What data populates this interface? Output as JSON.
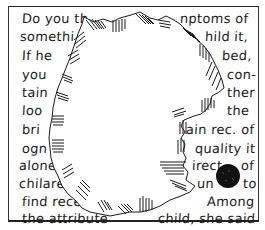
{
  "illustration": {
    "description": "Hand-drawn page of handwritten text with a large torn, hatched hole in the center and a black ink blot",
    "colors": {
      "ink": "#1a1a1a",
      "paper": "#ffffff",
      "blot": "#111111"
    }
  },
  "text_lines": {
    "left": [
      {
        "text": "Do you th",
        "x": 22,
        "y": 24
      },
      {
        "text": "somethi",
        "x": 20,
        "y": 42
      },
      {
        "text": "If he",
        "x": 22,
        "y": 61
      },
      {
        "text": "you",
        "x": 22,
        "y": 80
      },
      {
        "text": "tain",
        "x": 22,
        "y": 98
      },
      {
        "text": "loo",
        "x": 22,
        "y": 116
      },
      {
        "text": "bri",
        "x": 22,
        "y": 135
      },
      {
        "text": "ogn",
        "x": 22,
        "y": 154
      },
      {
        "text": "alone",
        "x": 19,
        "y": 171
      },
      {
        "text": "chilare",
        "x": 19,
        "y": 189
      },
      {
        "text": "find recen",
        "x": 22,
        "y": 207
      },
      {
        "text": "the attribute",
        "x": 22,
        "y": 224
      }
    ],
    "right": [
      {
        "text": "nptoms of",
        "x": 180,
        "y": 24
      },
      {
        "text": "hild it,",
        "x": 205,
        "y": 42
      },
      {
        "text": "bed,",
        "x": 222,
        "y": 61
      },
      {
        "text": "con-",
        "x": 227,
        "y": 80
      },
      {
        "text": "ther",
        "x": 227,
        "y": 98
      },
      {
        "text": "the",
        "x": 227,
        "y": 116
      },
      {
        "text": "ain rec. of",
        "x": 186,
        "y": 135
      },
      {
        "text": "quality it",
        "x": 195,
        "y": 154
      },
      {
        "text": "irect",
        "x": 192,
        "y": 171
      },
      {
        "text": "of",
        "x": 241,
        "y": 171
      },
      {
        "text": "un",
        "x": 197,
        "y": 189
      },
      {
        "text": "to",
        "x": 243,
        "y": 189
      },
      {
        "text": "Among",
        "x": 207,
        "y": 207
      },
      {
        "text": "child, she said",
        "x": 158,
        "y": 224
      }
    ]
  }
}
